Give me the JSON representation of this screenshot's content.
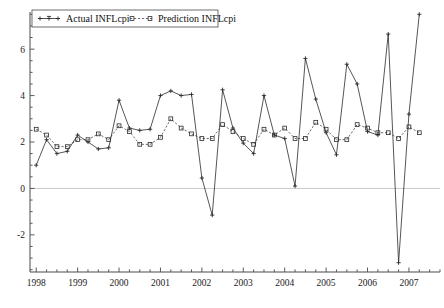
{
  "chart_data": {
    "type": "line",
    "title": "",
    "xlabel": "",
    "ylabel": "",
    "xlim": [
      1997.85,
      2007.75
    ],
    "ylim": [
      -3.6,
      7.6
    ],
    "yticks": [
      -2,
      0,
      2,
      4,
      6
    ],
    "ytick_labels": [
      "-2",
      "0",
      "2",
      "4",
      "6"
    ],
    "y_minor_step": 0.5,
    "xticks": [
      1998,
      1999,
      2000,
      2001,
      2002,
      2003,
      2004,
      2005,
      2006,
      2007
    ],
    "xtick_labels": [
      "1998",
      "1999",
      "2000",
      "2001",
      "2002",
      "2003",
      "2004",
      "2005",
      "2006",
      "2007"
    ],
    "x_minor_step": 0.25,
    "grid": false,
    "zero_line": true,
    "legend_position": "top-left",
    "x": [
      1998.0,
      1998.25,
      1998.5,
      1998.75,
      1999.0,
      1999.25,
      1999.5,
      1999.75,
      2000.0,
      2000.25,
      2000.5,
      2000.75,
      2001.0,
      2001.25,
      2001.5,
      2001.75,
      2002.0,
      2002.25,
      2002.5,
      2002.75,
      2003.0,
      2003.25,
      2003.5,
      2003.75,
      2004.0,
      2004.25,
      2004.5,
      2004.75,
      2005.0,
      2005.25,
      2005.5,
      2005.75,
      2006.0,
      2006.25,
      2006.5,
      2006.75,
      2007.0,
      2007.25
    ],
    "series": [
      {
        "name": "Actual INFLcpi",
        "marker": "plus",
        "linestyle": "solid",
        "color": "#2b2b2b",
        "values": [
          1.0,
          2.1,
          1.5,
          1.6,
          2.3,
          2.0,
          1.7,
          1.75,
          3.8,
          2.6,
          2.5,
          2.55,
          4.0,
          4.2,
          4.0,
          4.05,
          0.45,
          -1.15,
          4.25,
          2.6,
          1.95,
          1.5,
          4.0,
          2.3,
          2.15,
          0.1,
          5.6,
          3.85,
          2.4,
          1.45,
          5.35,
          4.5,
          2.45,
          2.3,
          6.65,
          -3.2,
          3.2,
          7.5
        ]
      },
      {
        "name": "Prediction INFLcpi",
        "marker": "square",
        "linestyle": "dashed",
        "color": "#2b2b2b",
        "values": [
          2.55,
          2.3,
          1.8,
          1.8,
          2.1,
          2.1,
          2.35,
          2.1,
          2.7,
          2.45,
          1.9,
          1.9,
          2.2,
          3.0,
          2.6,
          2.35,
          2.15,
          2.15,
          2.75,
          2.45,
          2.15,
          1.9,
          2.55,
          2.3,
          2.6,
          2.15,
          2.15,
          2.85,
          2.55,
          2.1,
          2.1,
          2.75,
          2.6,
          2.4,
          2.4,
          2.15,
          2.65,
          2.4
        ]
      }
    ]
  },
  "legend": {
    "entries": [
      {
        "label": "Actual INFLcpi",
        "marker": "plus"
      },
      {
        "label": "Prediction INFLcpi",
        "marker": "square"
      }
    ]
  }
}
